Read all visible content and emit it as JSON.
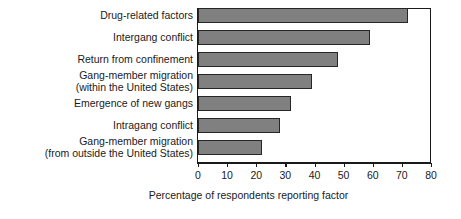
{
  "chart_data": {
    "type": "bar",
    "orientation": "horizontal",
    "title": "",
    "xlabel": "Percentage of respondents reporting factor",
    "ylabel": "",
    "xlim": [
      0,
      80
    ],
    "xticks": [
      0,
      10,
      20,
      30,
      40,
      50,
      60,
      70,
      80
    ],
    "xtick_labels": [
      "0",
      "10",
      "20",
      "30",
      "40",
      "50",
      "60",
      "70",
      "80"
    ],
    "grid": false,
    "legend": null,
    "bar_color": "#808080",
    "bar_edge_color": "#262626",
    "categories": [
      "Drug-related factors",
      "Intergang conflict",
      "Return from confinement",
      "Gang-member migration (within the United States)",
      "Emergence of new gangs",
      "Intragang conflict",
      "Gang-member migration (from outside the United States)"
    ],
    "category_lines": [
      [
        "Drug-related factors"
      ],
      [
        "Intergang conflict"
      ],
      [
        "Return from confinement"
      ],
      [
        "Gang-member migration",
        "(within the United States)"
      ],
      [
        "Emergence of new gangs"
      ],
      [
        "Intragang conflict"
      ],
      [
        "Gang-member migration",
        "(from outside the United States)"
      ]
    ],
    "values": [
      72,
      59,
      48,
      39,
      32,
      28,
      22
    ]
  }
}
